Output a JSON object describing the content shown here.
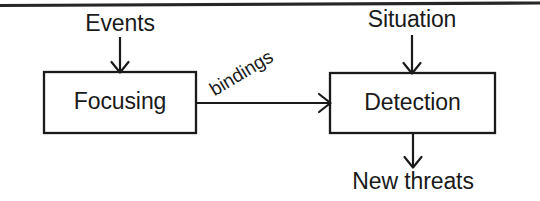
{
  "diagram": {
    "type": "flow-diagram",
    "background_color": "#ffffff",
    "stroke_color": "#1a1a1a",
    "top_rule": {
      "name": "page-top-rule",
      "present": true
    },
    "nodes": [
      {
        "id": "focusing",
        "label": "Focusing",
        "shape": "rectangle",
        "x": 44,
        "y": 72,
        "width": 152,
        "height": 61
      },
      {
        "id": "detection",
        "label": "Detection",
        "shape": "rectangle",
        "x": 330,
        "y": 73,
        "width": 165,
        "height": 60
      }
    ],
    "io_labels": [
      {
        "id": "events",
        "label": "Events",
        "role": "input",
        "target": "focusing"
      },
      {
        "id": "situation",
        "label": "Situation",
        "role": "input",
        "target": "detection"
      },
      {
        "id": "new-threats",
        "label": "New threats",
        "role": "output",
        "source": "detection"
      }
    ],
    "edges": [
      {
        "id": "events-to-focusing",
        "label": "",
        "from": "Events",
        "to": "Focusing",
        "direction": "down"
      },
      {
        "id": "focusing-to-detection",
        "label": "bindings",
        "from": "Focusing",
        "to": "Detection",
        "direction": "right"
      },
      {
        "id": "situation-to-detection",
        "label": "",
        "from": "Situation",
        "to": "Detection",
        "direction": "down"
      },
      {
        "id": "detection-to-new-threats",
        "label": "",
        "from": "Detection",
        "to": "New threats",
        "direction": "down"
      }
    ]
  }
}
